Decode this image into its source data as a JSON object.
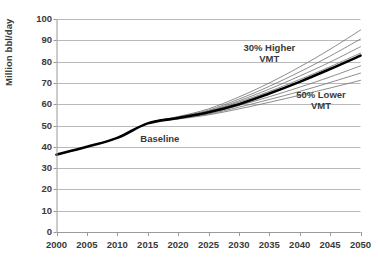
{
  "chart_data": {
    "type": "line",
    "title": "",
    "xlabel": "",
    "ylabel": "Million bbl/day",
    "xlim": [
      2000,
      2050
    ],
    "ylim": [
      0,
      100
    ],
    "grid": true,
    "legend_position": "inline-annotations",
    "x": [
      2000,
      2005,
      2010,
      2015,
      2020,
      2025,
      2030,
      2035,
      2040,
      2045,
      2050
    ],
    "xticklabels": [
      "2000",
      "2005",
      "2010",
      "2015",
      "2020",
      "2025",
      "2030",
      "2035",
      "2040",
      "2045",
      "2050"
    ],
    "yticks": [
      0,
      10,
      20,
      30,
      40,
      50,
      60,
      70,
      80,
      90,
      100
    ],
    "yticklabels": [
      "0",
      "10",
      "20",
      "30",
      "40",
      "50",
      "60",
      "70",
      "80",
      "90",
      "100"
    ],
    "annotations": [
      {
        "text": "Baseline",
        "x": 2017,
        "y": 43.5
      },
      {
        "text": "30% Higher\nVMT",
        "line1": "30% Higher",
        "line2": "VMT",
        "x": 2035,
        "y": 84
      },
      {
        "text": "50% Lower\nVMT",
        "line1": "50% Lower",
        "line2": "VMT",
        "x": 2043.5,
        "y": 62
      }
    ],
    "series": [
      {
        "name": "Baseline",
        "style": "thick-black",
        "color": "#000000",
        "width": 2.6,
        "values": [
          36.3,
          40.0,
          44.2,
          51.0,
          53.5,
          56.2,
          60.0,
          65.0,
          70.5,
          76.5,
          82.8
        ]
      },
      {
        "name": "30% Higher VMT",
        "style": "thin-gray",
        "color": "#6e6e6e",
        "width": 0.8,
        "values": [
          36.3,
          40.0,
          44.2,
          51.0,
          54.2,
          57.8,
          63.4,
          70.0,
          77.5,
          85.8,
          94.8
        ]
      },
      {
        "name": "Scenario 2",
        "style": "thin-gray",
        "color": "#6e6e6e",
        "width": 0.8,
        "values": [
          36.3,
          40.0,
          44.2,
          51.0,
          54.0,
          57.2,
          62.4,
          68.4,
          75.2,
          82.6,
          90.6
        ]
      },
      {
        "name": "Scenario 3",
        "style": "thin-gray",
        "color": "#6e6e6e",
        "width": 0.8,
        "values": [
          36.3,
          40.0,
          44.2,
          51.0,
          53.8,
          56.8,
          61.6,
          67.1,
          73.2,
          79.8,
          87.0
        ]
      },
      {
        "name": "Scenario 4",
        "style": "thin-gray",
        "color": "#6e6e6e",
        "width": 0.8,
        "values": [
          36.3,
          40.0,
          44.2,
          51.0,
          53.7,
          56.5,
          61.0,
          66.0,
          71.6,
          77.6,
          84.0
        ]
      },
      {
        "name": "Scenario 5",
        "style": "thin-gray",
        "color": "#6e6e6e",
        "width": 0.8,
        "values": [
          36.3,
          40.0,
          44.2,
          51.0,
          53.4,
          55.8,
          59.4,
          63.5,
          68.0,
          72.8,
          78.0
        ]
      },
      {
        "name": "Scenario 6",
        "style": "thin-gray",
        "color": "#6e6e6e",
        "width": 0.8,
        "values": [
          36.3,
          40.0,
          44.2,
          51.0,
          53.2,
          55.4,
          58.6,
          62.2,
          66.0,
          70.2,
          74.6
        ]
      },
      {
        "name": "50% Lower VMT",
        "style": "thin-gray",
        "color": "#6e6e6e",
        "width": 0.8,
        "values": [
          36.3,
          40.0,
          44.2,
          51.0,
          53.0,
          55.0,
          57.8,
          60.9,
          64.2,
          67.6,
          71.2
        ]
      }
    ]
  },
  "axis_style": {
    "gridline_color": "#b9b9b9",
    "axis_color": "#9a9a9a",
    "text_color": "#3a3a3a",
    "background": "#ffffff"
  }
}
